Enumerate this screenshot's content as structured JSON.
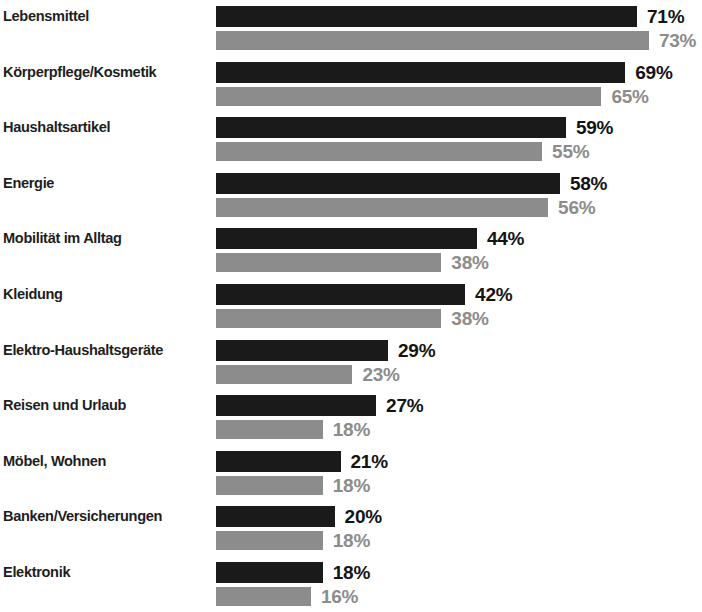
{
  "chart_data": {
    "type": "bar",
    "orientation": "horizontal",
    "title": "",
    "subtitle": "",
    "xlabel": "",
    "ylabel": "",
    "xlim": [
      0,
      75
    ],
    "grid": false,
    "legend_position": "none",
    "value_suffix": "%",
    "categories": [
      "Lebensmittel",
      "Körperpflege/Kosmetik",
      "Haushaltsartikel",
      "Energie",
      "Mobilität im Alltag",
      "Kleidung",
      "Elektro-Haushaltsgeräte",
      "Reisen und Urlaub",
      "Möbel, Wohnen",
      "Banken/Versicherungen",
      "Elektronik"
    ],
    "series": [
      {
        "name": "primary",
        "color": "#1a1a1a",
        "values": [
          71,
          69,
          59,
          58,
          44,
          42,
          29,
          27,
          21,
          20,
          18
        ],
        "labels": [
          "71%",
          "69%",
          "59%",
          "58%",
          "44%",
          "42%",
          "29%",
          "27%",
          "21%",
          "20%",
          "18%"
        ]
      },
      {
        "name": "secondary",
        "color": "#8c8c8c",
        "values": [
          73,
          65,
          55,
          56,
          38,
          38,
          23,
          18,
          18,
          18,
          16
        ],
        "labels": [
          "73%",
          "65%",
          "55%",
          "56%",
          "38%",
          "38%",
          "23%",
          "18%",
          "18%",
          "18%",
          "16%"
        ]
      }
    ]
  },
  "colors": {
    "primary_bar": "#1a1a1a",
    "secondary_bar": "#8c8c8c",
    "label_text": "#1e1e1e",
    "background": "#ffffff"
  },
  "scale": {
    "px_per_percent": 5.93
  }
}
